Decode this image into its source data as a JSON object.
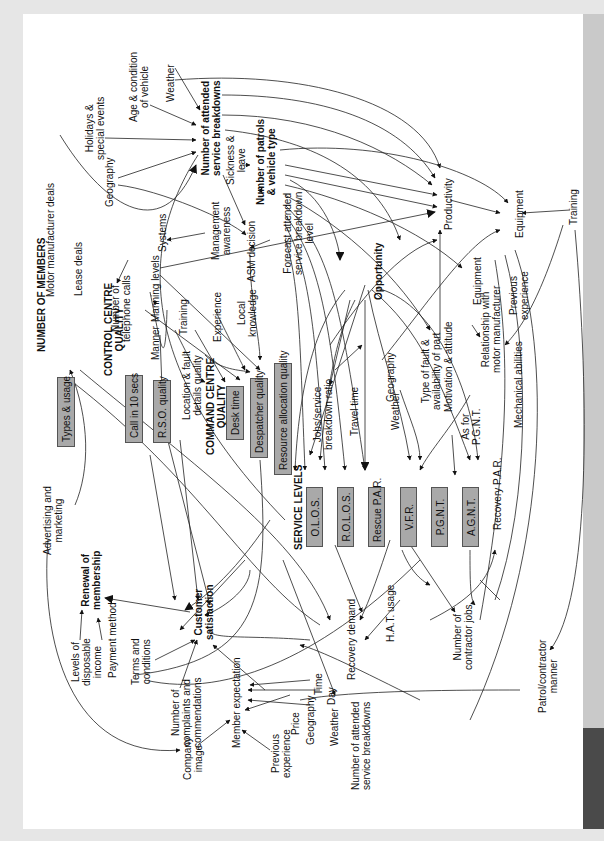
{
  "diagram": {
    "orientation": "rotated 90 degrees counter-clockwise",
    "headings": {
      "number_of_members": "NUMBER OF MEMBERS",
      "control_centre_quality": "CONTROL CENTRE\nQUALITY",
      "command_centre_quality": "COMMAND CENTRE\nQUALITY",
      "service_levels": "SERVICE LEVELS",
      "number_of_attended_breakdowns": "Number of attended\nservice breakdowns",
      "number_of_patrols": "Number of patrols\n& vehicle type",
      "opportunity": "Opportunity",
      "customer_satisfaction": "Customer\nsatisfaction",
      "renewal_of_membership": "Renewal of\nmembership"
    },
    "boxes": {
      "types_usage": "Types & usage",
      "call_10_secs": "Call in 10 secs",
      "rso_quality": "R.S.O. quality",
      "desk_time": "Desk time",
      "despatcher_quality": "Despatcher quality",
      "resource_allocation_quality": "Resource allocation quality",
      "olos": "O.L.O.S.",
      "rolos": "R.O.L.O.S.",
      "rescue_par": "Rescue P.A.R.",
      "vfr": "V.F.R.",
      "pgnt": "P.G.N.T.",
      "agnt": "A.G.N.T."
    },
    "labels": {
      "motor_manufacturer_deals": "Motor manufacturer deals",
      "lease_deals": "Lease deals",
      "geography_top": "Geography",
      "holidays": "Holidays &\nspecial events",
      "age_condition": "Age & condition\nof vehicle",
      "weather_top": "Weather",
      "sickness_leave": "Sickness &\nleave",
      "management_awareness": "Management\nawareness",
      "systems": "Systems",
      "asm_decision": "ASM decision",
      "forecast": "Forecast attended\nservice breakdown\nlevel",
      "manning_levels": "Manning levels",
      "number_telephone_calls": "Number of\ntelephone calls",
      "manner": "Manner",
      "training_left": "Training",
      "experience": "Experience",
      "local_knowledge": "Local\nknowledge",
      "location_fault": "Location & fault\ndetails quality",
      "productivity": "Productivity",
      "equipment_right": "Equipment",
      "training_right": "Training",
      "equipment_mid": "Equipment",
      "relationship": "Relationship with\nmotor manufacturer",
      "previous_experience_right": "Previous\nexperience",
      "mechanical_abilities": "Mechanical abilities",
      "jobs_ratio": "Jobs/service\nbreakdown ratio",
      "travel_time": "Travel time",
      "geography_mid": "Geography",
      "weather_mid": "Weather",
      "type_of_fault": "Type of fault &\navailability of part",
      "motivation": "Motivation & attitude",
      "as_for_pgnt": "As for\nP.G.N.T.",
      "recovery_par": "Recovery P.A.R.",
      "advertising": "Advertising and\nmarketing",
      "levels_income": "Levels of\ndisposable\nincome",
      "payment_method": "Payment method",
      "terms": "Terms and\nconditions",
      "complaints": "Number of\ncomplaints and\ncommendations",
      "company_image": "Company\nimage",
      "member_expectation": "Member expectation",
      "previous_experience_bottom": "Previous\nexperience",
      "time": "Time",
      "day": "Day",
      "price": "Price",
      "geography_bottom": "Geography",
      "recovery_demand": "Recovery demand",
      "hat_usage": "H.A.T. usage",
      "number_contractor_jobs": "Number of\ncontractor jobs",
      "weather_bottom": "Weather",
      "attended_bottom": "Number of attended\nservice breakdowns",
      "patrol_contractor": "Patrol/contractor\nmanner"
    }
  }
}
